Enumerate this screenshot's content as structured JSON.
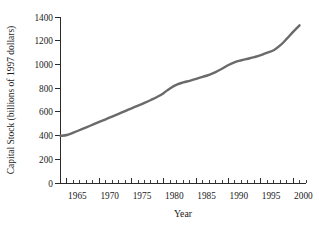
{
  "chart_data": {
    "type": "line",
    "title": "",
    "subtitle": "",
    "xlabel": "Year",
    "ylabel": "Capital Stock (billions of 1997 dollars)",
    "xlim": [
      1964,
      2002
    ],
    "ylim": [
      0,
      1400
    ],
    "grid": false,
    "legend": null,
    "line_color": "#6a6a6a",
    "axis_color": "#2b2b2b",
    "background": "#ffffff",
    "x_tick_labels": [
      "1965",
      "1970",
      "1975",
      "1980",
      "1985",
      "1990",
      "1995",
      "2000"
    ],
    "x_major_ticks": [
      1965,
      1970,
      1975,
      1980,
      1985,
      1990,
      1995,
      2000
    ],
    "x_minor_tick_step": 1,
    "y_tick_labels": [
      "0",
      "200",
      "400",
      "600",
      "800",
      "1000",
      "1200",
      "1400"
    ],
    "y_major_ticks": [
      0,
      200,
      400,
      600,
      800,
      1000,
      1200,
      1400
    ],
    "x": [
      1964,
      1965,
      1966,
      1967,
      1968,
      1969,
      1970,
      1971,
      1972,
      1973,
      1974,
      1975,
      1976,
      1977,
      1978,
      1979,
      1980,
      1981,
      1982,
      1983,
      1984,
      1985,
      1986,
      1987,
      1988,
      1989,
      1990,
      1991,
      1992,
      1993,
      1994,
      1995,
      1996,
      1997,
      1998,
      1999,
      2000,
      2001
    ],
    "values": [
      398,
      405,
      425,
      447,
      470,
      492,
      515,
      537,
      560,
      583,
      607,
      630,
      652,
      675,
      700,
      727,
      760,
      800,
      830,
      848,
      862,
      878,
      895,
      912,
      935,
      963,
      995,
      1020,
      1035,
      1048,
      1062,
      1078,
      1100,
      1120,
      1160,
      1215,
      1275,
      1330
    ],
    "annotations": []
  },
  "axis": {
    "y_title": "Capital Stock (billions of 1997 dollars)",
    "x_title": "Year"
  }
}
